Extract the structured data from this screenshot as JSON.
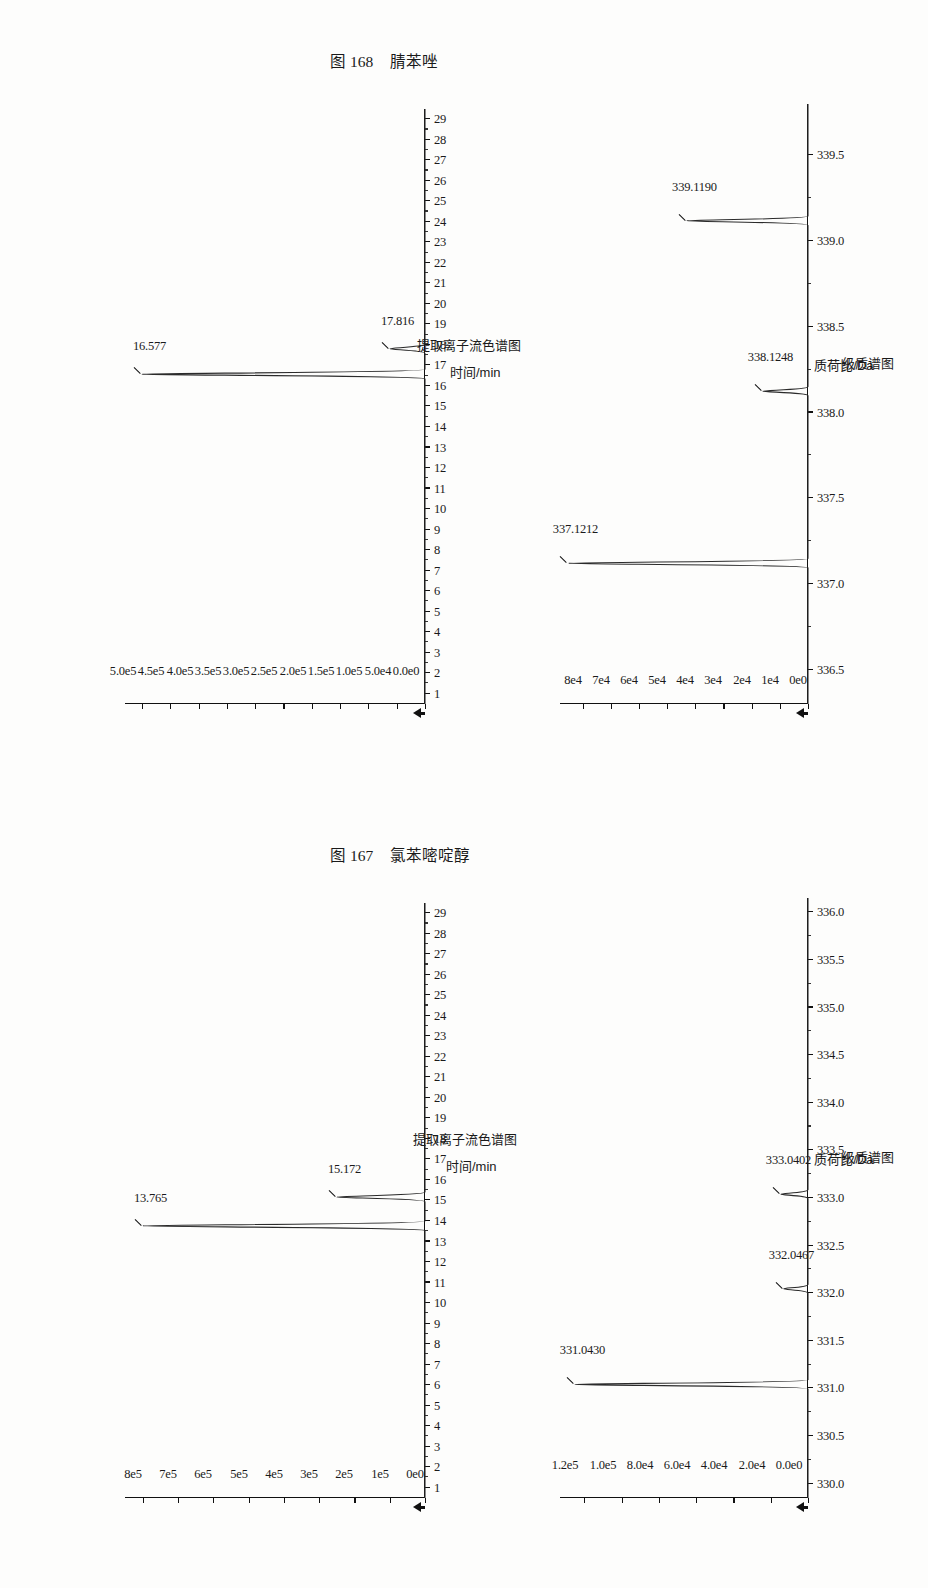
{
  "page": {
    "figures": [
      {
        "id": "fig167",
        "caption_number": "图 167",
        "caption_name": "氯苯嘧啶醇",
        "eic": {
          "type": "line",
          "title": "",
          "xlabel": "时间/min",
          "subtitle": "提取离子流色谱图",
          "xticks": [
            "1",
            "2",
            "3",
            "4",
            "5",
            "6",
            "7",
            "8",
            "9",
            "10",
            "11",
            "12",
            "13",
            "14",
            "15",
            "16",
            "17",
            "18",
            "19",
            "20",
            "21",
            "22",
            "23",
            "24",
            "25",
            "26",
            "27",
            "28",
            "29"
          ],
          "xlim": [
            0.5,
            29.5
          ],
          "yticks": [
            "0e0",
            "1e5",
            "2e5",
            "3e5",
            "4e5",
            "5e5",
            "6e5",
            "7e5",
            "8e5"
          ],
          "ytickvals": [
            0,
            100000,
            200000,
            300000,
            400000,
            500000,
            600000,
            700000,
            800000
          ],
          "ylim": [
            0,
            850000
          ],
          "ylabel": "",
          "peaks": [
            {
              "label": "13.765",
              "x": 13.765,
              "y": 800000
            },
            {
              "label": "15.172",
              "x": 15.172,
              "y": 250000
            }
          ]
        },
        "ms": {
          "type": "line",
          "title": "",
          "xlabel": "质荷比/Da",
          "subtitle": "一级质谱图",
          "xticks": [
            "330.0",
            "330.5",
            "331.0",
            "331.5",
            "332.0",
            "332.5",
            "333.0",
            "333.5",
            "334.0",
            "334.5",
            "335.0",
            "335.5",
            "336.0"
          ],
          "xtickvals": [
            330.0,
            330.5,
            331.0,
            331.5,
            332.0,
            332.5,
            333.0,
            333.5,
            334.0,
            334.5,
            335.0,
            335.5,
            336.0
          ],
          "xlim": [
            329.85,
            336.15
          ],
          "yticks": [
            "0.0e0",
            "2.0e4",
            "4.0e4",
            "6.0e4",
            "8.0e4",
            "1.0e5",
            "1.2e5"
          ],
          "ytickvals": [
            0,
            20000,
            40000,
            60000,
            80000,
            100000,
            120000
          ],
          "ylim": [
            0,
            133000
          ],
          "ylabel": "",
          "peaks": [
            {
              "label": "331.0430",
              "x": 331.043,
              "y": 125000
            },
            {
              "label": "332.0467",
              "x": 332.0467,
              "y": 13000
            },
            {
              "label": "333.0402",
              "x": 333.0402,
              "y": 14500
            }
          ]
        }
      },
      {
        "id": "fig168",
        "caption_number": "图 168",
        "caption_name": "腈苯唑",
        "eic": {
          "type": "line",
          "title": "",
          "xlabel": "时间/min",
          "subtitle": "提取离子流色谱图",
          "xticks": [
            "1",
            "2",
            "3",
            "4",
            "5",
            "6",
            "7",
            "8",
            "9",
            "10",
            "11",
            "12",
            "13",
            "14",
            "15",
            "16",
            "17",
            "18",
            "19",
            "20",
            "21",
            "22",
            "23",
            "24",
            "25",
            "26",
            "27",
            "28",
            "29"
          ],
          "xlim": [
            0.5,
            29.5
          ],
          "yticks": [
            "0.0e0",
            "5.0e4",
            "1.0e5",
            "1.5e5",
            "2.0e5",
            "2.5e5",
            "3.0e5",
            "3.5e5",
            "4.0e5",
            "4.5e5",
            "5.0e5"
          ],
          "ytickvals": [
            0,
            50000,
            100000,
            150000,
            200000,
            250000,
            300000,
            350000,
            400000,
            450000,
            500000
          ],
          "ylim": [
            0,
            530000
          ],
          "ylabel": "",
          "peaks": [
            {
              "label": "16.577",
              "x": 16.577,
              "y": 500000
            },
            {
              "label": "17.816",
              "x": 17.816,
              "y": 62000
            }
          ]
        },
        "ms": {
          "type": "line",
          "title": "",
          "xlabel": "质荷比/Da",
          "subtitle": "一级质谱图",
          "xticks": [
            "336.5",
            "337.0",
            "337.5",
            "338.0",
            "338.5",
            "339.0",
            "339.5"
          ],
          "xtickvals": [
            336.5,
            337.0,
            337.5,
            338.0,
            338.5,
            339.0,
            339.5
          ],
          "xlim": [
            336.3,
            339.8
          ],
          "yticks": [
            "0e0",
            "1e4",
            "2e4",
            "3e4",
            "4e4",
            "5e4",
            "6e4",
            "7e4",
            "8e4"
          ],
          "ytickvals": [
            0,
            10000,
            20000,
            30000,
            40000,
            50000,
            60000,
            70000,
            80000
          ],
          "ylim": [
            0,
            88000
          ],
          "ylabel": "",
          "peaks": [
            {
              "label": "337.1212",
              "x": 337.1212,
              "y": 85000
            },
            {
              "label": "338.1248",
              "x": 338.1248,
              "y": 16000
            },
            {
              "label": "339.1190",
              "x": 339.119,
              "y": 43000
            }
          ]
        }
      }
    ]
  },
  "chart_data": [
    {
      "type": "line",
      "chart_id": "fig167-eic",
      "title": "提取离子流色谱图",
      "xlabel": "时间/min",
      "ylabel": "",
      "xlim": [
        0.5,
        29.5
      ],
      "ylim": [
        0,
        850000
      ],
      "grid": false,
      "legend": "none",
      "xticks": [
        1,
        2,
        3,
        4,
        5,
        6,
        7,
        8,
        9,
        10,
        11,
        12,
        13,
        14,
        15,
        16,
        17,
        18,
        19,
        20,
        21,
        22,
        23,
        24,
        25,
        26,
        27,
        28,
        29
      ],
      "ytick_labels": [
        "0e0",
        "1e5",
        "2e5",
        "3e5",
        "4e5",
        "5e5",
        "6e5",
        "7e5",
        "8e5"
      ],
      "yticks": [
        0,
        100000,
        200000,
        300000,
        400000,
        500000,
        600000,
        700000,
        800000
      ],
      "annotations": [
        "13.765",
        "15.172"
      ],
      "x": [
        13.765,
        15.172
      ],
      "values": [
        800000,
        250000
      ]
    },
    {
      "type": "line",
      "chart_id": "fig167-ms",
      "title": "一级质谱图",
      "xlabel": "质荷比/Da",
      "ylabel": "",
      "xlim": [
        329.85,
        336.15
      ],
      "ylim": [
        0,
        133000
      ],
      "grid": false,
      "legend": "none",
      "xticks": [
        330.0,
        330.5,
        331.0,
        331.5,
        332.0,
        332.5,
        333.0,
        333.5,
        334.0,
        334.5,
        335.0,
        335.5,
        336.0
      ],
      "ytick_labels": [
        "0.0e0",
        "2.0e4",
        "4.0e4",
        "6.0e4",
        "8.0e4",
        "1.0e5",
        "1.2e5"
      ],
      "yticks": [
        0,
        20000,
        40000,
        60000,
        80000,
        100000,
        120000
      ],
      "annotations": [
        "331.0430",
        "332.0467",
        "333.0402"
      ],
      "x": [
        331.043,
        332.0467,
        333.0402
      ],
      "values": [
        125000,
        13000,
        14500
      ]
    },
    {
      "type": "line",
      "chart_id": "fig168-eic",
      "title": "提取离子流色谱图",
      "xlabel": "时间/min",
      "ylabel": "",
      "xlim": [
        0.5,
        29.5
      ],
      "ylim": [
        0,
        530000
      ],
      "grid": false,
      "legend": "none",
      "xticks": [
        1,
        2,
        3,
        4,
        5,
        6,
        7,
        8,
        9,
        10,
        11,
        12,
        13,
        14,
        15,
        16,
        17,
        18,
        19,
        20,
        21,
        22,
        23,
        24,
        25,
        26,
        27,
        28,
        29
      ],
      "ytick_labels": [
        "0.0e0",
        "5.0e4",
        "1.0e5",
        "1.5e5",
        "2.0e5",
        "2.5e5",
        "3.0e5",
        "3.5e5",
        "4.0e5",
        "4.5e5",
        "5.0e5"
      ],
      "yticks": [
        0,
        50000,
        100000,
        150000,
        200000,
        250000,
        300000,
        350000,
        400000,
        450000,
        500000
      ],
      "annotations": [
        "16.577",
        "17.816"
      ],
      "x": [
        16.577,
        17.816
      ],
      "values": [
        500000,
        62000
      ]
    },
    {
      "type": "line",
      "chart_id": "fig168-ms",
      "title": "一级质谱图",
      "xlabel": "质荷比/Da",
      "ylabel": "",
      "xlim": [
        336.3,
        339.8
      ],
      "ylim": [
        0,
        88000
      ],
      "grid": false,
      "legend": "none",
      "xticks": [
        336.5,
        337.0,
        337.5,
        338.0,
        338.5,
        339.0,
        339.5
      ],
      "ytick_labels": [
        "0e0",
        "1e4",
        "2e4",
        "3e4",
        "4e4",
        "5e4",
        "6e4",
        "7e4",
        "8e4"
      ],
      "yticks": [
        0,
        10000,
        20000,
        30000,
        40000,
        50000,
        60000,
        70000,
        80000
      ],
      "annotations": [
        "337.1212",
        "338.1248",
        "339.1190"
      ],
      "x": [
        337.1212,
        338.1248,
        339.119
      ],
      "values": [
        85000,
        16000,
        43000
      ]
    }
  ]
}
